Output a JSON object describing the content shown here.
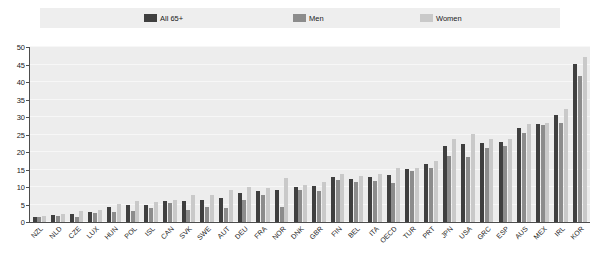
{
  "legend": {
    "items": [
      {
        "label": "All 65+",
        "color": "#3f3f3f",
        "icon": "series-swatch-icon"
      },
      {
        "label": "Men",
        "color": "#8c8c8c",
        "icon": "series-swatch-icon"
      },
      {
        "label": "Women",
        "color": "#c9c9c9",
        "icon": "series-swatch-icon"
      }
    ]
  },
  "axis": {
    "yticks": [
      "0",
      "5",
      "10",
      "15",
      "20",
      "25",
      "30",
      "35",
      "40",
      "45",
      "50"
    ]
  },
  "chart_data": {
    "type": "bar",
    "title": "",
    "xlabel": "",
    "ylabel": "",
    "ylim": [
      0,
      50
    ],
    "ytick_step": 5,
    "grid": true,
    "legend_position": "top",
    "orientation": "vertical",
    "categories": [
      "NZL",
      "NLD",
      "CZE",
      "LUX",
      "HUN",
      "POL",
      "ISL",
      "CAN",
      "SVK",
      "SWE",
      "AUT",
      "DEU",
      "FRA",
      "NOR",
      "DNK",
      "GBR",
      "FIN",
      "BEL",
      "ITA",
      "OECD",
      "TUR",
      "PRT",
      "JPN",
      "USA",
      "GRC",
      "ESP",
      "AUS",
      "MEX",
      "IRL",
      "KOR"
    ],
    "series": [
      {
        "name": "All 65+",
        "color": "#3f3f3f",
        "values": [
          1.5,
          2.0,
          2.3,
          3.0,
          4.3,
          4.8,
          5.0,
          5.9,
          5.9,
          6.2,
          7.0,
          8.4,
          8.8,
          9.1,
          10.0,
          10.3,
          12.8,
          12.4,
          12.8,
          13.5,
          15.1,
          16.6,
          21.7,
          22.4,
          22.7,
          22.8,
          26.9,
          28.0,
          30.6,
          45.1
        ]
      },
      {
        "name": "Men",
        "color": "#8c8c8c",
        "values": [
          1.4,
          1.8,
          1.3,
          2.5,
          2.9,
          3.2,
          4.1,
          5.4,
          3.3,
          4.4,
          4.0,
          6.2,
          7.6,
          4.4,
          9.1,
          8.8,
          11.9,
          11.4,
          11.6,
          11.1,
          14.5,
          15.4,
          18.9,
          18.6,
          21.2,
          21.8,
          25.5,
          27.7,
          28.3,
          41.8
        ]
      },
      {
        "name": "Women",
        "color": "#c9c9c9",
        "values": [
          1.7,
          2.2,
          3.1,
          3.4,
          5.2,
          6.0,
          5.7,
          6.3,
          7.8,
          7.7,
          9.2,
          10.1,
          9.7,
          12.7,
          10.7,
          11.5,
          13.6,
          13.2,
          13.7,
          15.3,
          15.5,
          17.5,
          23.6,
          25.1,
          23.8,
          23.6,
          28.1,
          28.3,
          32.4,
          47.2
        ]
      }
    ]
  }
}
